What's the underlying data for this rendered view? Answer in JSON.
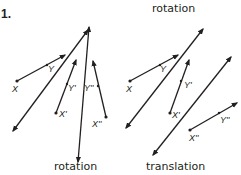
{
  "problem_number": "1.",
  "figures": [
    {
      "id": "left",
      "caption_top": "",
      "caption_bottom": "rotation",
      "labels": {
        "X": "X",
        "Y": "Y",
        "X1": "X'",
        "Y1": "Y'",
        "X2": "X''",
        "Y2": "Y''"
      }
    },
    {
      "id": "right",
      "caption_top": "rotation",
      "caption_bottom": "translation",
      "labels": {
        "X": "X",
        "Y": "Y",
        "X1": "X'",
        "Y1": "Y'",
        "X2": "X''",
        "Y2": "Y''"
      }
    }
  ],
  "colors": {
    "ink": "#231f20",
    "background": "#ffffff"
  }
}
